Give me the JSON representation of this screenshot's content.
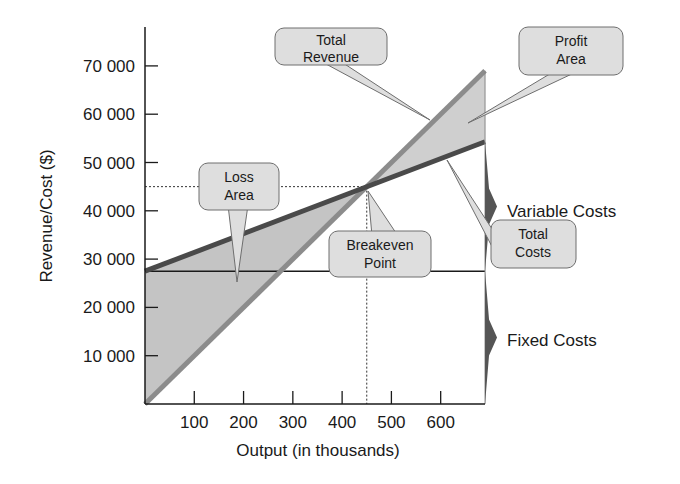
{
  "chart_data": {
    "type": "line",
    "title": "",
    "xlabel": "Output (in thousands)",
    "ylabel": "Revenue/Cost ($)",
    "xlim": [
      0,
      690
    ],
    "ylim": [
      0,
      78000
    ],
    "x_ticks": [
      100,
      200,
      300,
      400,
      500,
      600
    ],
    "x_tick_labels": [
      "100",
      "200",
      "300",
      "400",
      "500",
      "600"
    ],
    "y_ticks": [
      10000,
      20000,
      30000,
      40000,
      50000,
      60000,
      70000
    ],
    "y_tick_labels": [
      "10 000",
      "20 000",
      "30 000",
      "40 000",
      "50 000",
      "60 000",
      "70 000"
    ],
    "grid": false,
    "legend": null,
    "series": [
      {
        "name": "Total Revenue",
        "x": [
          0,
          690
        ],
        "y": [
          0,
          69000
        ],
        "color": "#8c8c8c"
      },
      {
        "name": "Total Costs",
        "x": [
          0,
          690
        ],
        "y": [
          27500,
          54300
        ],
        "color": "#4a4a4a"
      },
      {
        "name": "Fixed Costs",
        "x": [
          0,
          690
        ],
        "y": [
          27500,
          27500
        ],
        "color": "#1a1a1a"
      }
    ],
    "breakeven": {
      "x": 450,
      "y": 45000
    },
    "regions": [
      {
        "name": "Loss Area",
        "fill": "#c4c4c4"
      },
      {
        "name": "Profit Area",
        "fill": "#cfcfcf"
      }
    ],
    "annotations": [
      {
        "text": "Total Revenue",
        "target": "revenue line"
      },
      {
        "text": "Profit Area",
        "target": "profit region"
      },
      {
        "text": "Loss Area",
        "target": "loss region"
      },
      {
        "text": "Breakeven Point",
        "target": "intersection"
      },
      {
        "text": "Total Costs",
        "target": "cost line"
      },
      {
        "text": "Variable Costs",
        "target": "brace between fixed and total cost at right edge"
      },
      {
        "text": "Fixed Costs",
        "target": "brace between 0 and fixed cost at right edge"
      }
    ]
  },
  "labels": {
    "xlabel": "Output (in thousands)",
    "ylabel": "Revenue/Cost ($)",
    "callouts": {
      "total_revenue": [
        "Total",
        "Revenue"
      ],
      "profit_area": [
        "Profit",
        "Area"
      ],
      "loss_area": [
        "Loss",
        "Area"
      ],
      "breakeven": [
        "Breakeven",
        "Point"
      ],
      "total_costs": [
        "Total",
        "Costs"
      ]
    },
    "variable_costs": "Variable Costs",
    "fixed_costs": "Fixed Costs"
  },
  "colors": {
    "axis": "#1a1a1a",
    "revenue_line": "#8c8c8c",
    "cost_line": "#4a4a4a",
    "fixed_line": "#1a1a1a",
    "loss_fill": "#c4c4c4",
    "profit_fill": "#cfcfcf",
    "callout_fill": "#dedede",
    "callout_stroke": "#6e6e6e",
    "brace": "#555555"
  }
}
